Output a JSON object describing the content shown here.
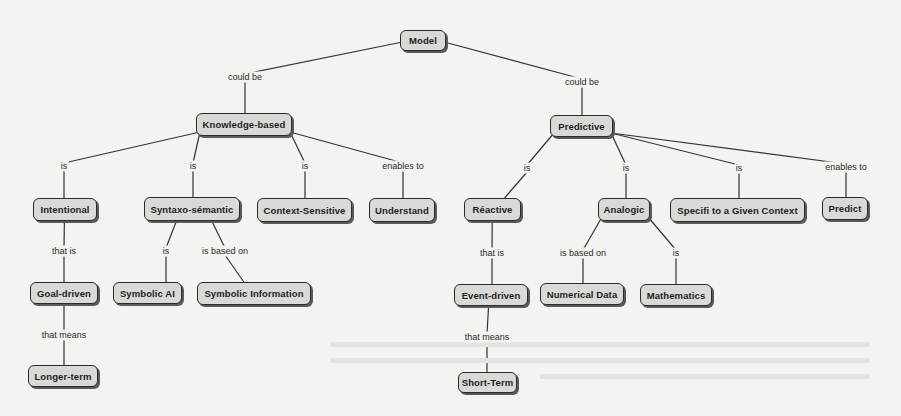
{
  "diagram": {
    "colors": {
      "background": "#f3f3f1",
      "node_fill": "#d9d9d7",
      "node_border": "#2a2a2a",
      "edge": "#333333"
    },
    "nodes": [
      {
        "id": "model",
        "label": "Model",
        "x": 400,
        "y": 30,
        "w": 46,
        "h": 21
      },
      {
        "id": "knowledge",
        "label": "Knowledge-based",
        "x": 196,
        "y": 113,
        "w": 96,
        "h": 23
      },
      {
        "id": "predictive",
        "label": "Predictive",
        "x": 550,
        "y": 115,
        "w": 63,
        "h": 22
      },
      {
        "id": "intentional",
        "label": "Intentional",
        "x": 33,
        "y": 198,
        "w": 64,
        "h": 23
      },
      {
        "id": "syntaxo",
        "label": "Syntaxo-sémantic",
        "x": 144,
        "y": 197,
        "w": 96,
        "h": 24
      },
      {
        "id": "context",
        "label": "Context-Sensitive",
        "x": 257,
        "y": 198,
        "w": 95,
        "h": 24
      },
      {
        "id": "understand",
        "label": "Understand",
        "x": 369,
        "y": 198,
        "w": 66,
        "h": 24
      },
      {
        "id": "reactive",
        "label": "Réactive",
        "x": 464,
        "y": 198,
        "w": 57,
        "h": 23
      },
      {
        "id": "analogic",
        "label": "Analogic",
        "x": 598,
        "y": 198,
        "w": 52,
        "h": 23
      },
      {
        "id": "specifi",
        "label": "Specifi to a Given Context",
        "x": 670,
        "y": 198,
        "w": 135,
        "h": 24
      },
      {
        "id": "predict",
        "label": "Predict",
        "x": 822,
        "y": 197,
        "w": 46,
        "h": 23
      },
      {
        "id": "goal",
        "label": "Goal-driven",
        "x": 30,
        "y": 282,
        "w": 68,
        "h": 22
      },
      {
        "id": "symai",
        "label": "Symbolic AI",
        "x": 113,
        "y": 282,
        "w": 69,
        "h": 22
      },
      {
        "id": "syminfo",
        "label": "Symbolic Information",
        "x": 197,
        "y": 282,
        "w": 114,
        "h": 23
      },
      {
        "id": "event",
        "label": "Event-driven",
        "x": 454,
        "y": 284,
        "w": 74,
        "h": 22
      },
      {
        "id": "numdata",
        "label": "Numerical Data",
        "x": 540,
        "y": 283,
        "w": 84,
        "h": 22
      },
      {
        "id": "math",
        "label": "Mathematics",
        "x": 640,
        "y": 284,
        "w": 72,
        "h": 22
      },
      {
        "id": "longer",
        "label": "Longer-term",
        "x": 28,
        "y": 365,
        "w": 70,
        "h": 22
      },
      {
        "id": "short",
        "label": "Short-Term",
        "x": 458,
        "y": 372,
        "w": 59,
        "h": 21
      }
    ],
    "links": [
      {
        "id": "l-model-kb",
        "label": "could be",
        "x": 245,
        "y": 77,
        "from": "model",
        "to": "knowledge"
      },
      {
        "id": "l-model-pred",
        "label": "could be",
        "x": 582,
        "y": 82,
        "from": "model",
        "to": "predictive"
      },
      {
        "id": "l-kb-int",
        "label": "is",
        "x": 64,
        "y": 166,
        "from": "knowledge",
        "to": "intentional"
      },
      {
        "id": "l-kb-syn",
        "label": "is",
        "x": 193,
        "y": 166,
        "from": "knowledge",
        "to": "syntaxo"
      },
      {
        "id": "l-kb-ctx",
        "label": "is",
        "x": 305,
        "y": 166,
        "from": "knowledge",
        "to": "context"
      },
      {
        "id": "l-kb-und",
        "label": "enables to",
        "x": 403,
        "y": 166,
        "from": "knowledge",
        "to": "understand"
      },
      {
        "id": "l-pred-rea",
        "label": "is",
        "x": 527,
        "y": 168,
        "from": "predictive",
        "to": "reactive"
      },
      {
        "id": "l-pred-ana",
        "label": "is",
        "x": 626,
        "y": 168,
        "from": "predictive",
        "to": "analogic"
      },
      {
        "id": "l-pred-spe",
        "label": "is",
        "x": 739,
        "y": 168,
        "from": "predictive",
        "to": "specifi"
      },
      {
        "id": "l-pred-pre",
        "label": "enables to",
        "x": 846,
        "y": 167,
        "from": "predictive",
        "to": "predict"
      },
      {
        "id": "l-int-goal",
        "label": "that is",
        "x": 64,
        "y": 251,
        "from": "intentional",
        "to": "goal"
      },
      {
        "id": "l-syn-ai",
        "label": "is",
        "x": 166,
        "y": 251,
        "from": "syntaxo",
        "to": "symai"
      },
      {
        "id": "l-syn-info",
        "label": "is based on",
        "x": 225,
        "y": 251,
        "from": "syntaxo",
        "to": "syminfo"
      },
      {
        "id": "l-rea-event",
        "label": "that is",
        "x": 492,
        "y": 253,
        "from": "reactive",
        "to": "event"
      },
      {
        "id": "l-ana-num",
        "label": "is based on",
        "x": 583,
        "y": 253,
        "from": "analogic",
        "to": "numdata"
      },
      {
        "id": "l-ana-math",
        "label": "is",
        "x": 676,
        "y": 253,
        "from": "analogic",
        "to": "math"
      },
      {
        "id": "l-goal-long",
        "label": "that means",
        "x": 64,
        "y": 335,
        "from": "goal",
        "to": "longer"
      },
      {
        "id": "l-event-short",
        "label": "that means",
        "x": 487,
        "y": 337,
        "from": "event",
        "to": "short"
      }
    ]
  }
}
